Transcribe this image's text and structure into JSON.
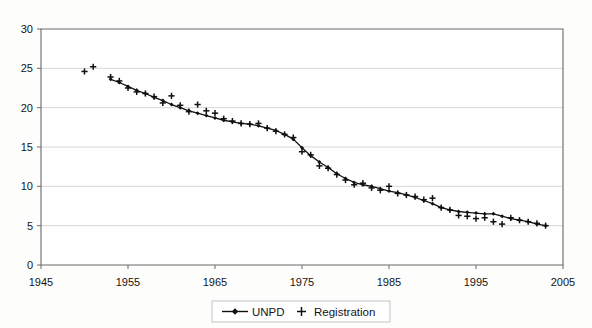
{
  "chart_data": {
    "type": "line",
    "title": "",
    "subtitle": "",
    "xlabel": "",
    "ylabel": "",
    "xlim": [
      1945,
      2005
    ],
    "ylim": [
      0,
      30
    ],
    "xticks": [
      1945,
      1955,
      1965,
      1975,
      1985,
      1995,
      2005
    ],
    "yticks": [
      0,
      5,
      10,
      15,
      20,
      25,
      30
    ],
    "xtick_labels": [
      "1945",
      "1955",
      "1965",
      "1975",
      "1985",
      "1995",
      "2005"
    ],
    "ytick_labels": [
      "0",
      "5",
      "10",
      "15",
      "20",
      "25",
      "30"
    ],
    "grid": "horizontal",
    "legend_position": "bottom-center",
    "legend": [
      {
        "name": "UNPD",
        "marker": "diamond-with-line",
        "color": "#111111"
      },
      {
        "name": "Registration",
        "marker": "plus",
        "color": "#111111"
      }
    ],
    "series": [
      {
        "name": "UNPD",
        "marker": "diamond",
        "style": "line",
        "x": [
          1953,
          1954,
          1955,
          1956,
          1957,
          1958,
          1959,
          1960,
          1961,
          1962,
          1963,
          1964,
          1965,
          1966,
          1967,
          1968,
          1969,
          1970,
          1971,
          1972,
          1973,
          1974,
          1975,
          1976,
          1977,
          1978,
          1979,
          1980,
          1981,
          1982,
          1983,
          1984,
          1985,
          1986,
          1987,
          1988,
          1989,
          1990,
          1991,
          1992,
          1993,
          1994,
          1995,
          1996,
          1997,
          1998,
          1999,
          2000,
          2001,
          2002,
          2003
        ],
        "y": [
          23.6,
          23.2,
          22.7,
          22.2,
          21.8,
          21.3,
          20.9,
          20.4,
          20.0,
          19.6,
          19.3,
          19.0,
          18.7,
          18.4,
          18.2,
          18.0,
          17.9,
          17.7,
          17.4,
          17.1,
          16.6,
          16.0,
          14.9,
          13.9,
          13.1,
          12.4,
          11.6,
          11.0,
          10.5,
          10.2,
          10.0,
          9.7,
          9.4,
          9.2,
          8.9,
          8.6,
          8.2,
          7.8,
          7.3,
          7.0,
          6.8,
          6.7,
          6.6,
          6.5,
          6.5,
          6.2,
          5.9,
          5.7,
          5.5,
          5.2,
          5.0
        ]
      },
      {
        "name": "Registration",
        "marker": "plus",
        "style": "scatter",
        "x": [
          1950,
          1951,
          1953,
          1954,
          1955,
          1956,
          1957,
          1958,
          1959,
          1960,
          1961,
          1962,
          1963,
          1964,
          1965,
          1966,
          1967,
          1968,
          1969,
          1970,
          1971,
          1972,
          1973,
          1974,
          1975,
          1976,
          1977,
          1978,
          1979,
          1980,
          1981,
          1982,
          1983,
          1984,
          1985,
          1986,
          1987,
          1988,
          1989,
          1990,
          1991,
          1992,
          1993,
          1994,
          1995,
          1996,
          1997,
          1998,
          1999,
          2000,
          2001,
          2002,
          2003
        ],
        "y": [
          24.6,
          25.2,
          23.9,
          23.4,
          22.5,
          22.0,
          21.8,
          21.4,
          20.6,
          21.5,
          20.3,
          19.5,
          20.4,
          19.6,
          19.3,
          18.6,
          18.3,
          18.0,
          17.9,
          18.0,
          17.4,
          17.0,
          16.6,
          16.2,
          14.4,
          14.0,
          12.6,
          12.3,
          11.5,
          10.8,
          10.2,
          10.4,
          9.8,
          9.5,
          10.0,
          9.1,
          8.9,
          8.7,
          8.3,
          8.5,
          7.3,
          7.0,
          6.3,
          6.2,
          5.9,
          6.0,
          5.5,
          5.2,
          6.0,
          5.7,
          5.5,
          5.3,
          5.0
        ]
      }
    ]
  }
}
